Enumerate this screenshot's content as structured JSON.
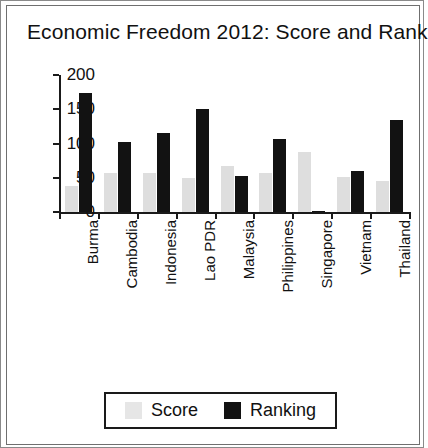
{
  "chart_data": {
    "type": "bar",
    "title": "Economic Freedom 2012: Score and Rank",
    "xlabel": "",
    "ylabel": "",
    "ylim": [
      0,
      200
    ],
    "yticks": [
      0,
      50,
      100,
      150,
      200
    ],
    "grid": false,
    "legend_position": "bottom",
    "categories": [
      "Burma",
      "Cambodia",
      "Indonesia",
      "Lao PDR",
      "Malaysia",
      "Philippines",
      "Singapore",
      "Vietnam",
      "Thailand"
    ],
    "series": [
      {
        "name": "Score",
        "color": "#dedede",
        "values": [
          38,
          57,
          57,
          50,
          67,
          57,
          88,
          51,
          45
        ]
      },
      {
        "name": "Ranking",
        "color": "#121212",
        "values": [
          174,
          102,
          115,
          150,
          52,
          107,
          2,
          60,
          135
        ]
      }
    ]
  },
  "legend": {
    "items": [
      {
        "label": "Score",
        "swatch": "score-swatch"
      },
      {
        "label": "Ranking",
        "swatch": "ranking-swatch"
      }
    ]
  }
}
